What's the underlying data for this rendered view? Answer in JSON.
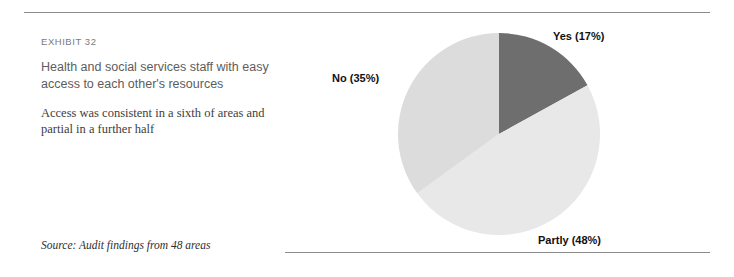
{
  "exhibit": {
    "label": "EXHIBIT 32",
    "title": "Health and social services staff with easy access to each other's resources",
    "subtitle": "Access was consistent in a sixth of areas and partial in a further half",
    "source": "Source: Audit findings from 48 areas"
  },
  "chart_data": {
    "type": "pie",
    "title": "Health and social services staff with easy access to each other's resources",
    "categories": [
      "Yes",
      "Partly",
      "No"
    ],
    "values": [
      17,
      48,
      35
    ],
    "unit": "%",
    "labels": [
      {
        "name": "Yes",
        "value": "(17%)",
        "color": "#6e6e6e"
      },
      {
        "name": "Partly",
        "value": "(48%)",
        "color": "#e8e8e8"
      },
      {
        "name": "No",
        "value": "(35%)",
        "color": "#dcdcdc"
      }
    ],
    "start_angle_deg": 0,
    "direction": "clockwise",
    "legend": "inline-callouts",
    "grid": false,
    "colors": {
      "yes": "#6e6e6e",
      "partly": "#e8e8e8",
      "no": "#dcdcdc",
      "rule": "#8c8c8c"
    }
  }
}
